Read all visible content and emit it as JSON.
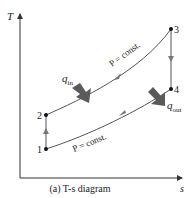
{
  "diagram": {
    "caption": "(a) T-s diagram",
    "axes": {
      "y_label": "T",
      "x_label": "s"
    },
    "points": [
      {
        "id": "1",
        "label": "1"
      },
      {
        "id": "2",
        "label": "2"
      },
      {
        "id": "3",
        "label": "3"
      },
      {
        "id": "4",
        "label": "4"
      }
    ],
    "processes": [
      {
        "from": "1",
        "to": "2",
        "type": "isentropic compression"
      },
      {
        "from": "2",
        "to": "3",
        "type": "constant pressure",
        "label": "P = const."
      },
      {
        "from": "3",
        "to": "4",
        "type": "isentropic expansion"
      },
      {
        "from": "4",
        "to": "1",
        "type": "constant pressure",
        "label": "P = const."
      }
    ],
    "heat": {
      "in": {
        "symbol": "q",
        "subscript": "in"
      },
      "out": {
        "symbol": "q",
        "subscript": "out"
      }
    },
    "colors": {
      "axis": "#333333",
      "curve": "#555555",
      "arrow": "#666666",
      "heat_arrow": "#555555",
      "point": "#111111"
    }
  }
}
